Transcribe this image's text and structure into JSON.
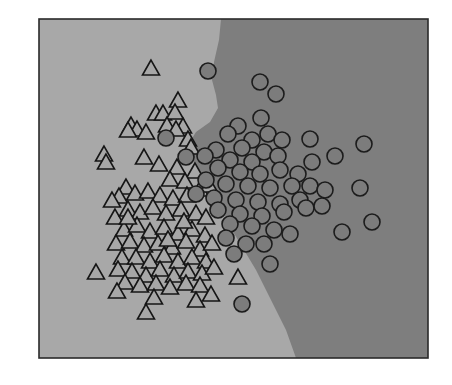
{
  "chart_data": {
    "type": "scatter",
    "title": "",
    "xlabel": "",
    "ylabel": "",
    "grid": false,
    "legend": null,
    "axes_visible": false,
    "plot_area_px": {
      "x0": 39,
      "y0": 19,
      "x1": 428,
      "y1": 358
    },
    "colors": {
      "region_class_a": "#a8a8a8",
      "region_class_b": "#7e7e7e",
      "triangle_fill": "#a7a7a7",
      "circle_fill": "#7c7c7c",
      "marker_edge": "#161616",
      "frame": "#2a2a2a"
    },
    "decision_boundary_px": [
      [
        221,
        19
      ],
      [
        219,
        40
      ],
      [
        214,
        62
      ],
      [
        212,
        80
      ],
      [
        216,
        95
      ],
      [
        218,
        108
      ],
      [
        210,
        122
      ],
      [
        196,
        132
      ],
      [
        188,
        145
      ],
      [
        192,
        160
      ],
      [
        200,
        172
      ],
      [
        212,
        190
      ],
      [
        222,
        210
      ],
      [
        232,
        230
      ],
      [
        244,
        250
      ],
      [
        256,
        270
      ],
      [
        266,
        290
      ],
      [
        276,
        310
      ],
      [
        286,
        330
      ],
      [
        296,
        358
      ]
    ],
    "series": [
      {
        "name": "class A",
        "marker": "triangle",
        "points_px": [
          [
            151,
            69
          ],
          [
            178,
            101
          ],
          [
            156,
            114
          ],
          [
            163,
            114
          ],
          [
            175,
            113
          ],
          [
            131,
            126
          ],
          [
            137,
            130
          ],
          [
            128,
            131
          ],
          [
            146,
            133
          ],
          [
            167,
            126
          ],
          [
            183,
            127
          ],
          [
            176,
            130
          ],
          [
            188,
            140
          ],
          [
            191,
            148
          ],
          [
            104,
            155
          ],
          [
            106,
            163
          ],
          [
            144,
            158
          ],
          [
            159,
            165
          ],
          [
            177,
            168
          ],
          [
            195,
            172
          ],
          [
            170,
            180
          ],
          [
            185,
            182
          ],
          [
            126,
            188
          ],
          [
            119,
            197
          ],
          [
            112,
            201
          ],
          [
            135,
            194
          ],
          [
            148,
            192
          ],
          [
            160,
            196
          ],
          [
            173,
            199
          ],
          [
            187,
            196
          ],
          [
            200,
            190
          ],
          [
            209,
            186
          ],
          [
            115,
            218
          ],
          [
            128,
            210
          ],
          [
            140,
            213
          ],
          [
            153,
            208
          ],
          [
            166,
            214
          ],
          [
            181,
            210
          ],
          [
            196,
            214
          ],
          [
            206,
            218
          ],
          [
            124,
            230
          ],
          [
            137,
            226
          ],
          [
            150,
            232
          ],
          [
            164,
            228
          ],
          [
            178,
            234
          ],
          [
            192,
            230
          ],
          [
            205,
            236
          ],
          [
            116,
            244
          ],
          [
            130,
            242
          ],
          [
            144,
            246
          ],
          [
            158,
            244
          ],
          [
            172,
            248
          ],
          [
            186,
            242
          ],
          [
            200,
            250
          ],
          [
            212,
            244
          ],
          [
            122,
            258
          ],
          [
            136,
            258
          ],
          [
            150,
            262
          ],
          [
            164,
            256
          ],
          [
            178,
            262
          ],
          [
            192,
            258
          ],
          [
            206,
            262
          ],
          [
            118,
            270
          ],
          [
            132,
            272
          ],
          [
            146,
            276
          ],
          [
            160,
            270
          ],
          [
            174,
            276
          ],
          [
            188,
            272
          ],
          [
            202,
            274
          ],
          [
            214,
            268
          ],
          [
            96,
            273
          ],
          [
            125,
            283
          ],
          [
            140,
            286
          ],
          [
            156,
            284
          ],
          [
            170,
            288
          ],
          [
            186,
            284
          ],
          [
            200,
            286
          ],
          [
            117,
            292
          ],
          [
            154,
            298
          ],
          [
            146,
            313
          ],
          [
            196,
            301
          ],
          [
            211,
            295
          ],
          [
            238,
            278
          ],
          [
            128,
            218
          ],
          [
            168,
            240
          ],
          [
            184,
            222
          ]
        ]
      },
      {
        "name": "class B",
        "marker": "circle",
        "points_px": [
          [
            208,
            71
          ],
          [
            260,
            82
          ],
          [
            276,
            94
          ],
          [
            166,
            138
          ],
          [
            261,
            118
          ],
          [
            238,
            126
          ],
          [
            268,
            134
          ],
          [
            282,
            140
          ],
          [
            228,
            134
          ],
          [
            310,
            139
          ],
          [
            364,
            144
          ],
          [
            252,
            140
          ],
          [
            216,
            150
          ],
          [
            242,
            148
          ],
          [
            264,
            152
          ],
          [
            278,
            156
          ],
          [
            205,
            156
          ],
          [
            186,
            157
          ],
          [
            312,
            162
          ],
          [
            335,
            156
          ],
          [
            230,
            160
          ],
          [
            252,
            162
          ],
          [
            218,
            168
          ],
          [
            240,
            172
          ],
          [
            260,
            174
          ],
          [
            280,
            170
          ],
          [
            298,
            174
          ],
          [
            206,
            180
          ],
          [
            226,
            184
          ],
          [
            248,
            186
          ],
          [
            270,
            188
          ],
          [
            292,
            186
          ],
          [
            310,
            186
          ],
          [
            325,
            190
          ],
          [
            360,
            188
          ],
          [
            196,
            194
          ],
          [
            214,
            198
          ],
          [
            236,
            200
          ],
          [
            258,
            202
          ],
          [
            280,
            204
          ],
          [
            300,
            200
          ],
          [
            218,
            210
          ],
          [
            240,
            214
          ],
          [
            262,
            216
          ],
          [
            284,
            212
          ],
          [
            306,
            208
          ],
          [
            322,
            206
          ],
          [
            230,
            224
          ],
          [
            252,
            226
          ],
          [
            274,
            230
          ],
          [
            290,
            234
          ],
          [
            372,
            222
          ],
          [
            342,
            232
          ],
          [
            226,
            238
          ],
          [
            246,
            244
          ],
          [
            264,
            244
          ],
          [
            234,
            254
          ],
          [
            270,
            264
          ],
          [
            242,
            304
          ]
        ]
      }
    ]
  }
}
